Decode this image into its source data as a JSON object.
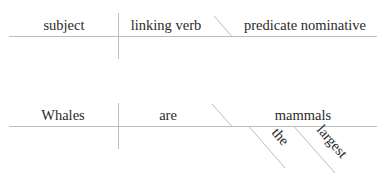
{
  "template_diagram": {
    "subject": "subject",
    "verb": "linking verb",
    "predicate": "predicate nominative"
  },
  "example_diagram": {
    "subject": "Whales",
    "verb": "are",
    "predicate": "mammals",
    "modifiers": [
      "the",
      "largest"
    ]
  },
  "colors": {
    "line": "#bdbdbd",
    "text": "#2a2a2a",
    "background": "#ffffff"
  }
}
